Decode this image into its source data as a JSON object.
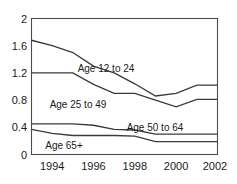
{
  "chart_data": {
    "type": "line",
    "title": "",
    "xlabel": "",
    "ylabel": "",
    "x": [
      1993,
      1994,
      1995,
      1996,
      1997,
      1998,
      1999,
      2000,
      2001,
      2002
    ],
    "xlim": [
      1993,
      2002
    ],
    "ylim": [
      0,
      2
    ],
    "yticks": [
      0,
      0.4,
      0.8,
      1.2,
      1.6,
      2
    ],
    "ytick_labels": [
      "0",
      "0.4",
      "0.8",
      "1.2",
      "1.6",
      "2"
    ],
    "xticks": [
      1994,
      1996,
      1998,
      2000,
      2002
    ],
    "xtick_labels": [
      "1994",
      "1996",
      "1998",
      "2000",
      "2002"
    ],
    "grid": false,
    "legend_position": "inline-labels",
    "series": [
      {
        "name": "Age 12 to 24",
        "values": [
          1.68,
          1.6,
          1.5,
          1.3,
          1.2,
          1.04,
          0.86,
          0.9,
          1.02,
          1.02
        ]
      },
      {
        "name": "Age 25 to 49",
        "values": [
          1.2,
          1.2,
          1.2,
          1.03,
          0.9,
          0.9,
          0.8,
          0.7,
          0.81,
          0.81
        ]
      },
      {
        "name": "Age 50 to 64",
        "values": [
          0.45,
          0.45,
          0.45,
          0.43,
          0.37,
          0.36,
          0.3,
          0.3,
          0.3,
          0.3
        ]
      },
      {
        "name": "Age 65+",
        "values": [
          0.37,
          0.31,
          0.28,
          0.28,
          0.28,
          0.27,
          0.19,
          0.19,
          0.19,
          0.19
        ]
      }
    ]
  },
  "axis": {
    "y_labels": [
      "2",
      "1.6",
      "1.2",
      "0.8",
      "0.4",
      "0"
    ],
    "x_labels": [
      "1994",
      "1996",
      "1998",
      "2000",
      "2002"
    ]
  },
  "series_labels": {
    "s0": "Age 12 to 24",
    "s1": "Age 25 to 49",
    "s2": "Age 50 to 64",
    "s3": "Age 65+"
  },
  "colors": {
    "line": "#3a3a3a",
    "frame": "#4d4d4d",
    "text": "#1a1a1a",
    "background": "#ffffff"
  }
}
